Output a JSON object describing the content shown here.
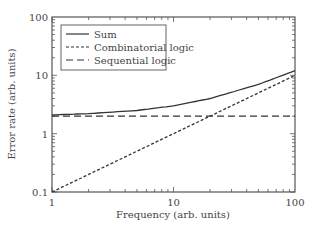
{
  "chart_data": {
    "type": "line",
    "title": "",
    "xlabel": "Frequency (arb. units)",
    "ylabel": "Error rate (arb. units)",
    "xscale": "log",
    "yscale": "log",
    "xlim": [
      1,
      100
    ],
    "ylim": [
      0.1,
      100
    ],
    "x_ticks": [
      "1",
      "10",
      "100"
    ],
    "y_ticks": [
      "0.1",
      "1",
      "10",
      "100"
    ],
    "grid": false,
    "legend_position": "upper left",
    "x": [
      1,
      2,
      5,
      10,
      20,
      50,
      100
    ],
    "series": [
      {
        "name": "Sum",
        "style": "solid",
        "values": [
          2.1,
          2.2,
          2.5,
          3.0,
          4.0,
          7.0,
          12.0
        ]
      },
      {
        "name": "Combinatorial logic",
        "style": "short-dash",
        "values": [
          0.1,
          0.2,
          0.5,
          1.0,
          2.0,
          5.0,
          10.0
        ]
      },
      {
        "name": "Sequential logic",
        "style": "long-dash",
        "values": [
          2.0,
          2.0,
          2.0,
          2.0,
          2.0,
          2.0,
          2.0
        ]
      }
    ]
  },
  "legend": {
    "items": [
      {
        "label": "Sum",
        "dash": ""
      },
      {
        "label": "Combinatorial logic",
        "dash": "3,2"
      },
      {
        "label": "Sequential logic",
        "dash": "7,4"
      }
    ]
  },
  "colors": {
    "line": "#333333",
    "frame": "#555555"
  }
}
